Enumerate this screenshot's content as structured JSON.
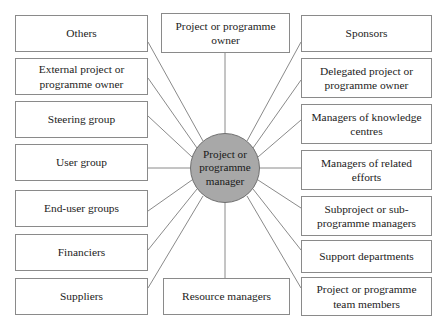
{
  "diagram": {
    "type": "hub-and-spoke-stakeholder-map",
    "center": {
      "label": "Project or programme manager",
      "shape": "circle",
      "fill_color": "#a8a8a8",
      "stroke_color": "#6f6f6f",
      "cx": 225,
      "cy": 168,
      "r": 35
    },
    "box_style": {
      "fill_color": "#ffffff",
      "stroke_color": "#8a8a8a",
      "text_color": "#1c1c1c"
    },
    "connector_color": "#8a8a8a",
    "columns": {
      "left": {
        "name": "left-column",
        "nodes": [
          {
            "label": "Others",
            "x": 15,
            "y": 15,
            "w": 133,
            "h": 37
          },
          {
            "label": "External project or programme owner",
            "x": 15,
            "y": 58,
            "w": 133,
            "h": 37
          },
          {
            "label": "Steering group",
            "x": 15,
            "y": 101,
            "w": 133,
            "h": 37
          },
          {
            "label": "User group",
            "x": 15,
            "y": 144,
            "w": 133,
            "h": 37
          },
          {
            "label": "End-user groups",
            "x": 15,
            "y": 190,
            "w": 133,
            "h": 37
          },
          {
            "label": "Financiers",
            "x": 15,
            "y": 234,
            "w": 133,
            "h": 37
          },
          {
            "label": "Suppliers",
            "x": 15,
            "y": 278,
            "w": 133,
            "h": 37
          }
        ]
      },
      "center": {
        "name": "center-column",
        "nodes": [
          {
            "label": "Project or programme owner",
            "x": 161,
            "y": 13,
            "w": 129,
            "h": 40
          },
          {
            "label": "Resource managers",
            "x": 163,
            "y": 278,
            "w": 127,
            "h": 37
          }
        ]
      },
      "right": {
        "name": "right-column",
        "nodes": [
          {
            "label": "Sponsors",
            "x": 301,
            "y": 15,
            "w": 131,
            "h": 37
          },
          {
            "label": "Delegated project or programme owner",
            "x": 301,
            "y": 58,
            "w": 131,
            "h": 40
          },
          {
            "label": "Managers of knowledge centres",
            "x": 301,
            "y": 104,
            "w": 131,
            "h": 40
          },
          {
            "label": "Managers of related efforts",
            "x": 301,
            "y": 150,
            "w": 131,
            "h": 40
          },
          {
            "label": "Subproject or sub-programme managers",
            "x": 301,
            "y": 196,
            "w": 131,
            "h": 40
          },
          {
            "label": "Support departments",
            "x": 301,
            "y": 240,
            "w": 131,
            "h": 33
          },
          {
            "label": "Project or programme team members",
            "x": 301,
            "y": 277,
            "w": 131,
            "h": 39
          }
        ]
      }
    },
    "connectors": [
      {
        "name": "connector-others",
        "x1": 203,
        "y1": 141,
        "x2": 148,
        "y2": 42
      },
      {
        "name": "connector-external-project-or-programme-owner",
        "x1": 197,
        "y1": 148,
        "x2": 148,
        "y2": 78
      },
      {
        "name": "connector-steering-group",
        "x1": 192,
        "y1": 157,
        "x2": 148,
        "y2": 116
      },
      {
        "name": "connector-user-group",
        "x1": 190,
        "y1": 168,
        "x2": 148,
        "y2": 168
      },
      {
        "name": "connector-end-user-groups",
        "x1": 192,
        "y1": 180,
        "x2": 148,
        "y2": 211
      },
      {
        "name": "connector-financiers",
        "x1": 197,
        "y1": 189,
        "x2": 148,
        "y2": 250
      },
      {
        "name": "connector-suppliers",
        "x1": 203,
        "y1": 196,
        "x2": 148,
        "y2": 288
      },
      {
        "name": "connector-project-or-programme-owner",
        "x1": 225,
        "y1": 133,
        "x2": 225,
        "y2": 53
      },
      {
        "name": "connector-resource-managers",
        "x1": 225,
        "y1": 203,
        "x2": 225,
        "y2": 278
      },
      {
        "name": "connector-sponsors",
        "x1": 247,
        "y1": 141,
        "x2": 301,
        "y2": 42
      },
      {
        "name": "connector-delegated-project-or-programme-owner",
        "x1": 253,
        "y1": 148,
        "x2": 301,
        "y2": 80
      },
      {
        "name": "connector-managers-of-knowledge-centres",
        "x1": 258,
        "y1": 157,
        "x2": 301,
        "y2": 120
      },
      {
        "name": "connector-managers-of-related-efforts",
        "x1": 260,
        "y1": 168,
        "x2": 301,
        "y2": 168
      },
      {
        "name": "connector-subproject-or-subprogramme-managers",
        "x1": 258,
        "y1": 180,
        "x2": 301,
        "y2": 208
      },
      {
        "name": "connector-support-departments",
        "x1": 253,
        "y1": 189,
        "x2": 301,
        "y2": 250
      },
      {
        "name": "connector-project-or-programme-team-members",
        "x1": 247,
        "y1": 196,
        "x2": 301,
        "y2": 288
      }
    ]
  }
}
